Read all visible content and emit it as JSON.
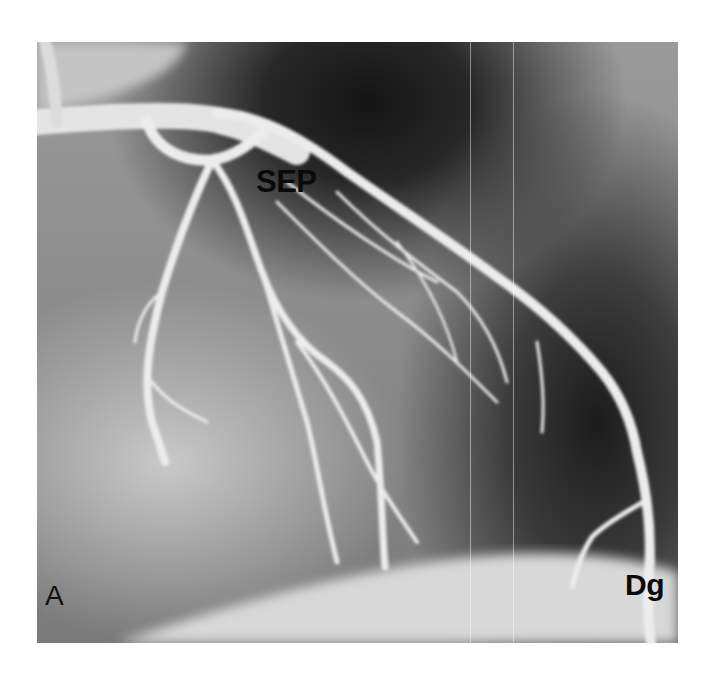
{
  "figure": {
    "panel_letter": "A",
    "labels": {
      "sep": "SEP",
      "dg": "Dg"
    },
    "colors": {
      "background": "#ffffff",
      "label_text": "#0a0a0a"
    }
  }
}
